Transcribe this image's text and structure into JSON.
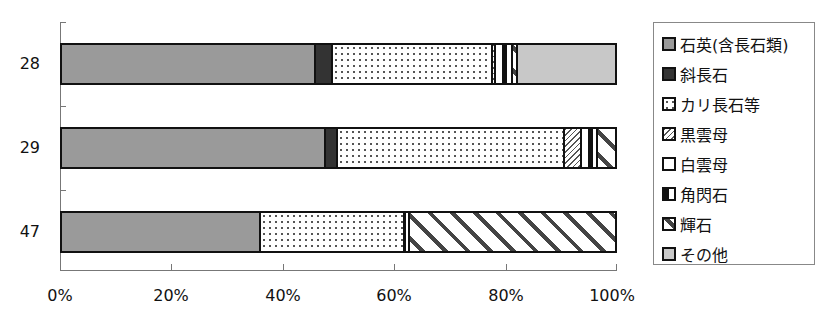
{
  "chart_data": {
    "type": "bar",
    "orientation": "horizontal",
    "stacked": "percent",
    "title": "",
    "xlabel": "",
    "ylabel": "",
    "categories": [
      "28",
      "29",
      "47"
    ],
    "x_ticks": [
      "0%",
      "20%",
      "40%",
      "60%",
      "80%",
      "100%"
    ],
    "xlim": [
      0,
      100
    ],
    "grid": false,
    "legend_position": "right",
    "series": [
      {
        "name": "石英(含長石類)",
        "pattern": "p-quartz",
        "values": [
          46,
          47.8,
          36
        ]
      },
      {
        "name": "斜長石",
        "pattern": "p-plag",
        "values": [
          3,
          2.2,
          0
        ]
      },
      {
        "name": "カリ長石等",
        "pattern": "p-kfs",
        "values": [
          29,
          41,
          26
        ]
      },
      {
        "name": "黒雲母",
        "pattern": "p-bio",
        "values": [
          0.5,
          3,
          0
        ]
      },
      {
        "name": "白雲母",
        "pattern": "p-mus",
        "values": [
          1.5,
          1.5,
          0
        ]
      },
      {
        "name": "角閃石",
        "pattern": "p-hbl",
        "values": [
          1.5,
          1.5,
          1
        ]
      },
      {
        "name": "輝石",
        "pattern": "p-pyx",
        "values": [
          1,
          3,
          37
        ]
      },
      {
        "name": "その他",
        "pattern": "p-other",
        "values": [
          17.5,
          0,
          0
        ]
      }
    ]
  },
  "legend": {
    "items": [
      {
        "label": "石英(含長石類)",
        "pattern": "p-quartz"
      },
      {
        "label": "斜長石",
        "pattern": "p-plag"
      },
      {
        "label": "カリ長石等",
        "pattern": "p-kfs"
      },
      {
        "label": "黒雲母",
        "pattern": "p-bio"
      },
      {
        "label": "白雲母",
        "pattern": "p-mus"
      },
      {
        "label": "角閃石",
        "pattern": "p-hbl"
      },
      {
        "label": "輝石",
        "pattern": "p-pyx"
      },
      {
        "label": "その他",
        "pattern": "p-other"
      }
    ]
  }
}
